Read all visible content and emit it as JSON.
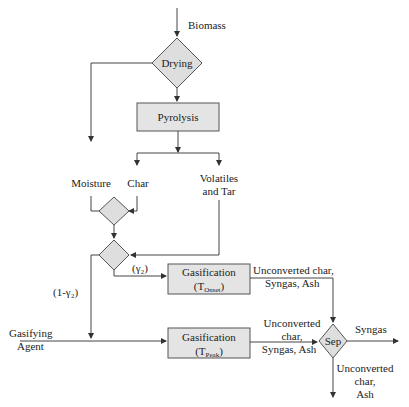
{
  "diagram": {
    "type": "process flowchart",
    "inputs": {
      "biomass": "Biomass",
      "gasifying_agent_line1": "Gasifying",
      "gasifying_agent_line2": "Agent"
    },
    "nodes": {
      "drying": "Drying",
      "pyrolysis": "Pyrolysis",
      "gasification_onset": {
        "label": "Gasification",
        "temp_main": "(T",
        "temp_sub": "Onset",
        "temp_close": ")"
      },
      "gasification_peak": {
        "label": "Gasification",
        "temp_main": "(T",
        "temp_sub": "Peak",
        "temp_close": ")"
      },
      "separator": "Sep"
    },
    "streams": {
      "moisture": "Moisture",
      "char": "Char",
      "volatiles_line1": "Volatiles",
      "volatiles_line2": "and Tar",
      "gamma2": "(γ₂)",
      "one_minus_gamma2": "(1-γ₂)",
      "onset_out_line1": "Unconverted char,",
      "onset_out_line2": "Syngas, Ash",
      "peak_out_line1": "Unconverted",
      "peak_out_line2": "char,",
      "peak_out_line3": "Syngas, Ash",
      "syngas": "Syngas",
      "sep_out_line1": "Unconverted",
      "sep_out_line2": "char,",
      "sep_out_line3": "Ash"
    }
  }
}
